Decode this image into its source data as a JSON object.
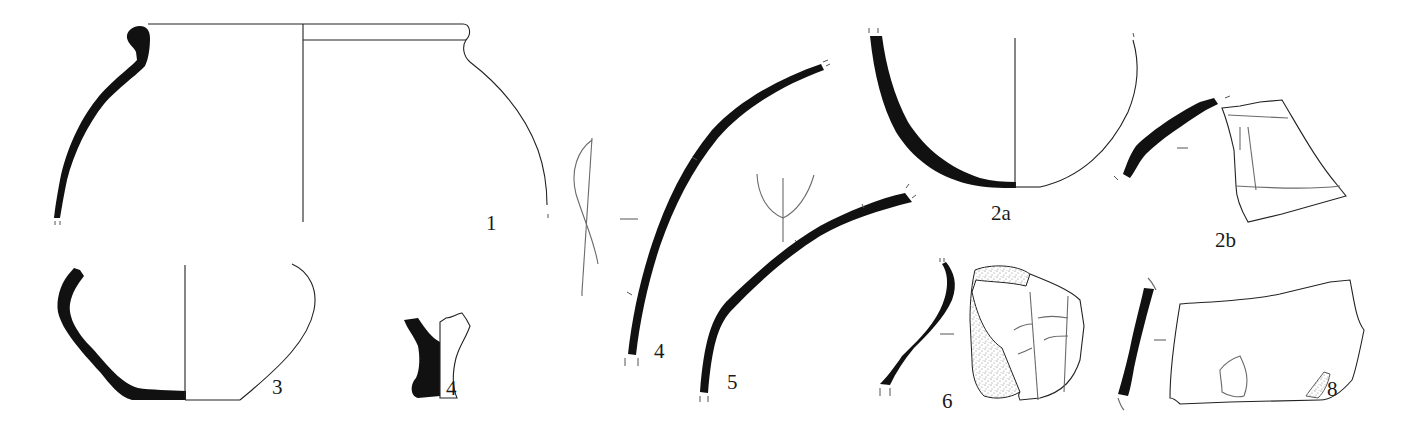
{
  "plate": {
    "type": "archaeological pottery drawing plate",
    "background": "#ffffff",
    "ink_color": "#111111",
    "stipple_color": "#9a9a9a"
  },
  "figures": [
    {
      "id": "1",
      "label": "1",
      "description": "everted-rim globular jar, profile section and exterior outline"
    },
    {
      "id": "2a",
      "label": "2a",
      "description": "rounded base, profile section and exterior outline"
    },
    {
      "id": "2b",
      "label": "2b",
      "description": "wall sherd section with incised-line decoration view"
    },
    {
      "id": "3",
      "label": "3",
      "description": "carinated bowl, profile section and exterior outline"
    },
    {
      "id": "4",
      "label": "4",
      "description": "small foot/stem fragment, section and outline"
    },
    {
      "id": "5",
      "label": "5",
      "description": "curved wall sherd section with side view of incision"
    },
    {
      "id": "6",
      "label": "6",
      "description": "wall sherd section with trident-shaped incision detail"
    },
    {
      "id": "7",
      "label": "7",
      "description": "wall sherd section with decorated exterior, stippled surface"
    },
    {
      "id": "8",
      "label": "8",
      "description": "wall sherd section with exterior view showing small motif"
    }
  ]
}
